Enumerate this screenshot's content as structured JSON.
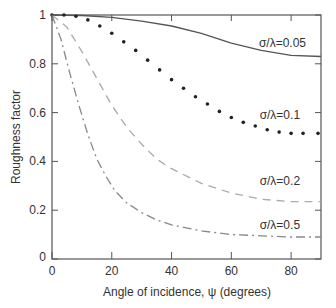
{
  "chart_data": {
    "type": "line",
    "title": "",
    "xlabel": "Angle of incidence, ψ (degrees)",
    "ylabel": "Roughness factor",
    "xlim": [
      0,
      90
    ],
    "ylim": [
      0,
      1
    ],
    "xticks": [
      0,
      20,
      40,
      60,
      80
    ],
    "yticks": [
      0,
      0.2,
      0.4,
      0.6,
      0.8,
      1
    ],
    "xtick_labels": [
      "0",
      "20",
      "40",
      "60",
      "80"
    ],
    "ytick_labels": [
      "0",
      "0.2",
      "0.4",
      "0.6",
      "0.8",
      "1"
    ],
    "grid": false,
    "legend": "inline labels",
    "series": [
      {
        "name": "σ/λ=0.05",
        "style": "solid",
        "color": "#555555",
        "label_pos": [
          85,
          0.87
        ],
        "x": [
          0,
          10,
          20,
          30,
          40,
          50,
          60,
          70,
          80,
          90
        ],
        "values": [
          1.0,
          0.998,
          0.99,
          0.975,
          0.955,
          0.925,
          0.885,
          0.855,
          0.835,
          0.83
        ]
      },
      {
        "name": "σ/λ=0.1",
        "style": "dotted",
        "color": "#222222",
        "label_pos": [
          83,
          0.575
        ],
        "x": [
          0,
          4,
          8,
          12,
          16,
          20,
          24,
          28,
          32,
          36,
          40,
          44,
          48,
          52,
          56,
          60,
          64,
          68,
          72,
          76,
          80,
          84,
          89
        ],
        "values": [
          1.0,
          1.0,
          0.995,
          0.98,
          0.955,
          0.925,
          0.89,
          0.855,
          0.815,
          0.775,
          0.735,
          0.7,
          0.665,
          0.635,
          0.605,
          0.58,
          0.56,
          0.545,
          0.53,
          0.52,
          0.515,
          0.515,
          0.515
        ]
      },
      {
        "name": "σ/λ=0.2",
        "style": "dashed",
        "color": "#aaaaaa",
        "label_pos": [
          83,
          0.305
        ],
        "x": [
          0,
          5,
          10,
          15,
          20,
          25,
          30,
          35,
          40,
          50,
          60,
          70,
          80,
          90
        ],
        "values": [
          1.0,
          0.95,
          0.85,
          0.74,
          0.63,
          0.54,
          0.47,
          0.41,
          0.37,
          0.31,
          0.27,
          0.245,
          0.235,
          0.235
        ]
      },
      {
        "name": "σ/λ=0.5",
        "style": "dash-dot",
        "color": "#888888",
        "label_pos": [
          83,
          0.125
        ],
        "x": [
          0,
          3,
          6,
          9,
          12,
          15,
          18,
          21,
          25,
          30,
          35,
          40,
          50,
          60,
          70,
          80,
          90
        ],
        "values": [
          1.0,
          0.9,
          0.76,
          0.63,
          0.51,
          0.41,
          0.34,
          0.28,
          0.23,
          0.19,
          0.16,
          0.14,
          0.115,
          0.1,
          0.095,
          0.09,
          0.09
        ]
      }
    ]
  }
}
